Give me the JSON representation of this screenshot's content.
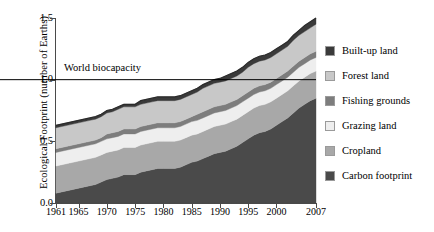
{
  "chart_data": {
    "type": "area",
    "title": "",
    "subtitle": "",
    "xlabel": "",
    "ylabel": "Ecological Footprint (number of Earths)",
    "xlim": [
      1961,
      2007
    ],
    "ylim": [
      0.0,
      1.5
    ],
    "grid": false,
    "stacked": true,
    "legend_position": "right",
    "xticklabels": [
      "1961",
      "1965",
      "1970",
      "1975",
      "1980",
      "1985",
      "1990",
      "1995",
      "2000",
      "2007"
    ],
    "xtickvalues": [
      1961,
      1965,
      1970,
      1975,
      1980,
      1985,
      1990,
      1995,
      2000,
      2007
    ],
    "yticklabels": [
      "0.0",
      "0.5",
      "1.0",
      "1.5"
    ],
    "ytickvalues": [
      0.0,
      0.5,
      1.0,
      1.5
    ],
    "annotations": [
      {
        "text": "World biocapacity",
        "y": 1.0,
        "type": "hline-label"
      }
    ],
    "reference_line": {
      "label": "World biocapacity",
      "value": 1.0,
      "color": "#000000"
    },
    "x": [
      1961,
      1962,
      1963,
      1964,
      1965,
      1966,
      1967,
      1968,
      1969,
      1970,
      1971,
      1972,
      1973,
      1974,
      1975,
      1976,
      1977,
      1978,
      1979,
      1980,
      1981,
      1982,
      1983,
      1984,
      1985,
      1986,
      1987,
      1988,
      1989,
      1990,
      1991,
      1992,
      1993,
      1994,
      1995,
      1996,
      1997,
      1998,
      1999,
      2000,
      2001,
      2002,
      2003,
      2004,
      2005,
      2006,
      2007
    ],
    "series": [
      {
        "name": "Carbon footprint",
        "color": "#4a4a4a",
        "values": [
          0.08,
          0.09,
          0.1,
          0.11,
          0.12,
          0.13,
          0.14,
          0.15,
          0.17,
          0.19,
          0.2,
          0.21,
          0.23,
          0.23,
          0.23,
          0.25,
          0.26,
          0.27,
          0.28,
          0.28,
          0.28,
          0.28,
          0.29,
          0.31,
          0.33,
          0.34,
          0.36,
          0.38,
          0.4,
          0.41,
          0.42,
          0.44,
          0.46,
          0.49,
          0.52,
          0.55,
          0.57,
          0.58,
          0.6,
          0.63,
          0.66,
          0.69,
          0.73,
          0.77,
          0.8,
          0.83,
          0.85
        ]
      },
      {
        "name": "Cropland",
        "color": "#a8a8a8",
        "values": [
          0.22,
          0.22,
          0.22,
          0.22,
          0.22,
          0.22,
          0.22,
          0.22,
          0.22,
          0.22,
          0.22,
          0.22,
          0.22,
          0.22,
          0.22,
          0.22,
          0.22,
          0.22,
          0.22,
          0.22,
          0.22,
          0.22,
          0.22,
          0.22,
          0.22,
          0.22,
          0.22,
          0.22,
          0.22,
          0.22,
          0.22,
          0.22,
          0.22,
          0.22,
          0.22,
          0.22,
          0.22,
          0.22,
          0.22,
          0.22,
          0.22,
          0.22,
          0.22,
          0.22,
          0.22,
          0.22,
          0.22
        ]
      },
      {
        "name": "Grazing land",
        "color": "#eeeeee",
        "values": [
          0.11,
          0.11,
          0.11,
          0.11,
          0.11,
          0.11,
          0.11,
          0.11,
          0.11,
          0.11,
          0.11,
          0.11,
          0.11,
          0.11,
          0.11,
          0.11,
          0.11,
          0.11,
          0.11,
          0.11,
          0.11,
          0.11,
          0.11,
          0.11,
          0.11,
          0.11,
          0.11,
          0.11,
          0.11,
          0.11,
          0.11,
          0.11,
          0.11,
          0.11,
          0.11,
          0.11,
          0.11,
          0.11,
          0.11,
          0.11,
          0.11,
          0.11,
          0.11,
          0.11,
          0.11,
          0.11,
          0.11
        ]
      },
      {
        "name": "Fishing grounds",
        "color": "#7d7d7d",
        "values": [
          0.03,
          0.03,
          0.03,
          0.03,
          0.03,
          0.03,
          0.03,
          0.03,
          0.03,
          0.04,
          0.04,
          0.04,
          0.04,
          0.04,
          0.04,
          0.04,
          0.04,
          0.04,
          0.04,
          0.04,
          0.04,
          0.04,
          0.04,
          0.04,
          0.04,
          0.05,
          0.05,
          0.05,
          0.05,
          0.05,
          0.05,
          0.05,
          0.05,
          0.05,
          0.05,
          0.05,
          0.05,
          0.05,
          0.05,
          0.05,
          0.05,
          0.05,
          0.05,
          0.05,
          0.05,
          0.05,
          0.05
        ]
      },
      {
        "name": "Forest land",
        "color": "#c8c8c8",
        "values": [
          0.17,
          0.17,
          0.17,
          0.17,
          0.17,
          0.17,
          0.17,
          0.17,
          0.17,
          0.17,
          0.17,
          0.18,
          0.18,
          0.18,
          0.18,
          0.18,
          0.18,
          0.18,
          0.18,
          0.18,
          0.18,
          0.18,
          0.18,
          0.18,
          0.18,
          0.18,
          0.19,
          0.19,
          0.19,
          0.19,
          0.19,
          0.19,
          0.19,
          0.19,
          0.2,
          0.2,
          0.2,
          0.2,
          0.2,
          0.2,
          0.2,
          0.2,
          0.21,
          0.21,
          0.21,
          0.21,
          0.22
        ]
      },
      {
        "name": "Built-up land",
        "color": "#3a3a3a",
        "values": [
          0.02,
          0.02,
          0.02,
          0.02,
          0.02,
          0.02,
          0.02,
          0.02,
          0.02,
          0.02,
          0.02,
          0.02,
          0.02,
          0.02,
          0.02,
          0.03,
          0.03,
          0.03,
          0.03,
          0.03,
          0.03,
          0.03,
          0.03,
          0.03,
          0.03,
          0.03,
          0.03,
          0.03,
          0.03,
          0.03,
          0.04,
          0.04,
          0.04,
          0.04,
          0.04,
          0.04,
          0.04,
          0.04,
          0.04,
          0.04,
          0.04,
          0.04,
          0.04,
          0.04,
          0.05,
          0.05,
          0.05
        ]
      }
    ],
    "totals": [
      0.63,
      0.64,
      0.65,
      0.66,
      0.67,
      0.68,
      0.69,
      0.7,
      0.72,
      0.75,
      0.76,
      0.78,
      0.8,
      0.8,
      0.8,
      0.83,
      0.84,
      0.85,
      0.86,
      0.86,
      0.86,
      0.86,
      0.87,
      0.89,
      0.91,
      0.93,
      0.96,
      0.98,
      1.0,
      1.01,
      1.03,
      1.05,
      1.07,
      1.1,
      1.14,
      1.17,
      1.19,
      1.2,
      1.22,
      1.25,
      1.28,
      1.31,
      1.36,
      1.4,
      1.43,
      1.47,
      1.5
    ]
  },
  "legend": {
    "items": [
      {
        "label": "Built-up land",
        "color": "#3a3a3a"
      },
      {
        "label": "Forest land",
        "color": "#c8c8c8"
      },
      {
        "label": "Fishing grounds",
        "color": "#7d7d7d"
      },
      {
        "label": "Grazing land",
        "color": "#eeeeee"
      },
      {
        "label": "Cropland",
        "color": "#a8a8a8"
      },
      {
        "label": "Carbon footprint",
        "color": "#4a4a4a"
      }
    ]
  }
}
